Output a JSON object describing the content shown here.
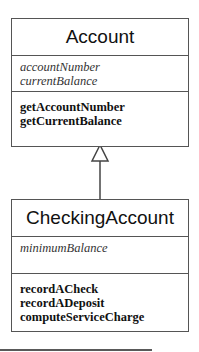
{
  "diagram": {
    "type": "uml-class-inheritance",
    "classes": [
      {
        "name": "Account",
        "attributes": [
          "accountNumber",
          "currentBalance"
        ],
        "methods": [
          "getAccountNumber",
          "getCurrentBalance"
        ]
      },
      {
        "name": "CheckingAccount",
        "attributes": [
          "minimumBalance"
        ],
        "methods": [
          "recordACheck",
          "recordADeposit",
          "computeServiceCharge"
        ]
      }
    ],
    "relationships": [
      {
        "from": "CheckingAccount",
        "to": "Account",
        "kind": "generalization"
      }
    ],
    "colors": {
      "line": "#555555",
      "text": "#111111",
      "background": "#ffffff"
    }
  }
}
